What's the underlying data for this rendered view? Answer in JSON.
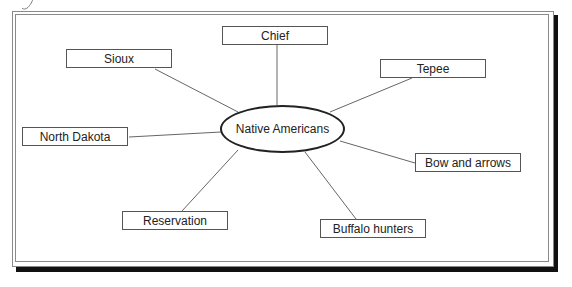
{
  "diagram": {
    "type": "concept-web",
    "center": {
      "label": "Native Americans"
    },
    "nodes": [
      {
        "id": "sioux",
        "label": "Sioux",
        "x": 66,
        "y": 49
      },
      {
        "id": "chief",
        "label": "Chief",
        "x": 222,
        "y": 26
      },
      {
        "id": "tepee",
        "label": "Tepee",
        "x": 380,
        "y": 59
      },
      {
        "id": "north-dakota",
        "label": "North Dakota",
        "x": 22,
        "y": 127
      },
      {
        "id": "bow-and-arrows",
        "label": "Bow and arrows",
        "x": 415,
        "y": 153
      },
      {
        "id": "reservation",
        "label": "Reservation",
        "x": 122,
        "y": 211
      },
      {
        "id": "buffalo-hunters",
        "label": "Buffalo hunters",
        "x": 320,
        "y": 219
      }
    ],
    "colors": {
      "line": "#666666",
      "box_border": "#555555",
      "shadow": "#111111",
      "frame": "#8a8a8a"
    }
  }
}
